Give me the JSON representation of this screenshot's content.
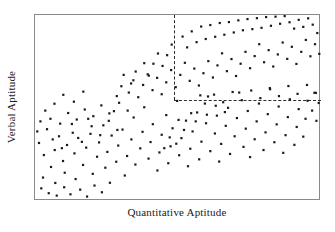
{
  "chart_data": {
    "type": "scatter",
    "title": "",
    "xlabel": "Quantitative Aptitude",
    "ylabel": "Verbal Aptitude",
    "xlim": [
      0,
      100
    ],
    "ylim": [
      0,
      100
    ],
    "grid": false,
    "legend": null,
    "marker": {
      "shape": "square",
      "size_px": 2.2,
      "color": "#1a1a1a"
    },
    "annotations": [
      {
        "type": "selection-region",
        "style": "dashed",
        "color": "#2b2b2b",
        "description": "Dashed lines mark upper-right region: high Quantitative and high Verbal Aptitude",
        "x_threshold": 48.6,
        "y_threshold": 54.3,
        "x_range": [
          48.6,
          100
        ],
        "y_range": [
          54.3,
          100
        ]
      }
    ],
    "series": [
      {
        "name": "Students",
        "n_points": 228,
        "description": "Positively correlated elliptical band rising from lower-left to upper-right",
        "points": [
          [
            1.4,
            31.2
          ],
          [
            3.1,
            24.7
          ],
          [
            4.2,
            38.6
          ],
          [
            5.6,
            18.3
          ],
          [
            2.8,
            12.6
          ],
          [
            6.9,
            27.4
          ],
          [
            8.4,
            34.8
          ],
          [
            7.1,
            9.7
          ],
          [
            9.8,
            21.5
          ],
          [
            11.2,
            30.1
          ],
          [
            10.4,
            15.2
          ],
          [
            12.9,
            41.4
          ],
          [
            13.8,
            25.6
          ],
          [
            15.1,
            33.9
          ],
          [
            14.2,
            11.8
          ],
          [
            16.8,
            19.4
          ],
          [
            17.9,
            28.7
          ],
          [
            18.6,
            44.2
          ],
          [
            19.4,
            36.1
          ],
          [
            20.2,
            14.6
          ],
          [
            21.7,
            23.8
          ],
          [
            22.4,
            31.5
          ],
          [
            23.9,
            40.7
          ],
          [
            24.6,
            17.9
          ],
          [
            25.3,
            26.4
          ],
          [
            26.8,
            35.2
          ],
          [
            27.6,
            48.3
          ],
          [
            28.4,
            21.1
          ],
          [
            29.1,
            29.8
          ],
          [
            30.6,
            38.4
          ],
          [
            31.4,
            13.7
          ],
          [
            32.2,
            24.2
          ],
          [
            33.7,
            33.1
          ],
          [
            34.5,
            44.9
          ],
          [
            35.1,
            19.6
          ],
          [
            36.8,
            28.3
          ],
          [
            37.6,
            37.2
          ],
          [
            38.2,
            50.4
          ],
          [
            39.7,
            22.8
          ],
          [
            40.4,
            31.7
          ],
          [
            41.2,
            41.3
          ],
          [
            42.8,
            16.4
          ],
          [
            43.5,
            26.1
          ],
          [
            44.3,
            35.6
          ],
          [
            45.9,
            46.2
          ],
          [
            46.6,
            20.3
          ],
          [
            47.4,
            29.4
          ],
          [
            48.1,
            39.1
          ],
          [
            49.7,
            53.8
          ],
          [
            50.4,
            24.6
          ],
          [
            51.2,
            33.8
          ],
          [
            52.8,
            43.2
          ],
          [
            53.5,
            18.7
          ],
          [
            54.3,
            28.1
          ],
          [
            55.1,
            37.4
          ],
          [
            56.7,
            47.6
          ],
          [
            57.4,
            22.4
          ],
          [
            58.2,
            31.9
          ],
          [
            59.8,
            41.8
          ],
          [
            60.5,
            56.2
          ],
          [
            61.3,
            26.8
          ],
          [
            62.9,
            36.3
          ],
          [
            63.6,
            45.9
          ],
          [
            64.4,
            21.2
          ],
          [
            65.1,
            30.7
          ],
          [
            66.7,
            40.4
          ],
          [
            67.5,
            50.1
          ],
          [
            68.2,
            25.3
          ],
          [
            69.8,
            34.8
          ],
          [
            70.6,
            44.6
          ],
          [
            71.4,
            58.3
          ],
          [
            72.9,
            29.1
          ],
          [
            73.7,
            38.9
          ],
          [
            74.4,
            48.4
          ],
          [
            75.2,
            23.6
          ],
          [
            76.8,
            33.2
          ],
          [
            77.5,
            42.8
          ],
          [
            78.3,
            52.4
          ],
          [
            79.9,
            27.4
          ],
          [
            80.6,
            36.9
          ],
          [
            81.4,
            46.7
          ],
          [
            82.2,
            60.1
          ],
          [
            83.7,
            31.6
          ],
          [
            84.5,
            41.2
          ],
          [
            85.2,
            50.8
          ],
          [
            86.8,
            25.9
          ],
          [
            87.6,
            35.4
          ],
          [
            88.4,
            45.1
          ],
          [
            89.1,
            54.7
          ],
          [
            90.7,
            30.2
          ],
          [
            91.5,
            39.8
          ],
          [
            92.2,
            49.4
          ],
          [
            93.8,
            34.6
          ],
          [
            94.6,
            44.2
          ],
          [
            95.3,
            53.9
          ],
          [
            96.9,
            48.6
          ],
          [
            97.7,
            58.2
          ],
          [
            98.4,
            43.1
          ],
          [
            99.2,
            52.7
          ],
          [
            28.6,
            56.4
          ],
          [
            30.2,
            61.7
          ],
          [
            32.8,
            58.3
          ],
          [
            34.4,
            64.9
          ],
          [
            36.1,
            55.8
          ],
          [
            37.8,
            62.4
          ],
          [
            39.4,
            68.1
          ],
          [
            41.1,
            59.6
          ],
          [
            42.7,
            66.2
          ],
          [
            44.3,
            57.4
          ],
          [
            45.9,
            63.8
          ],
          [
            47.6,
            70.4
          ],
          [
            49.2,
            61.2
          ],
          [
            50.8,
            67.8
          ],
          [
            52.4,
            74.3
          ],
          [
            54.1,
            64.6
          ],
          [
            55.7,
            71.2
          ],
          [
            57.3,
            62.1
          ],
          [
            58.9,
            68.7
          ],
          [
            60.6,
            75.2
          ],
          [
            62.2,
            66.4
          ],
          [
            63.8,
            72.9
          ],
          [
            65.4,
            79.4
          ],
          [
            67.1,
            69.8
          ],
          [
            68.7,
            76.3
          ],
          [
            70.3,
            67.2
          ],
          [
            71.9,
            73.8
          ],
          [
            73.6,
            80.2
          ],
          [
            75.2,
            71.4
          ],
          [
            76.8,
            77.9
          ],
          [
            78.4,
            84.3
          ],
          [
            80.1,
            74.6
          ],
          [
            81.7,
            81.1
          ],
          [
            83.3,
            72.3
          ],
          [
            84.9,
            78.8
          ],
          [
            86.6,
            85.2
          ],
          [
            88.2,
            76.4
          ],
          [
            89.8,
            82.9
          ],
          [
            91.4,
            73.7
          ],
          [
            93.1,
            80.2
          ],
          [
            94.7,
            86.6
          ],
          [
            96.3,
            77.8
          ],
          [
            97.9,
            84.3
          ],
          [
            99.4,
            79.1
          ],
          [
            51.6,
            88.4
          ],
          [
            53.2,
            82.6
          ],
          [
            54.8,
            91.2
          ],
          [
            56.5,
            85.4
          ],
          [
            58.1,
            93.8
          ],
          [
            59.7,
            87.1
          ],
          [
            61.3,
            94.6
          ],
          [
            63.0,
            88.3
          ],
          [
            64.6,
            95.7
          ],
          [
            66.2,
            89.4
          ],
          [
            67.8,
            96.2
          ],
          [
            69.5,
            90.6
          ],
          [
            71.1,
            97.1
          ],
          [
            72.7,
            91.8
          ],
          [
            74.3,
            97.8
          ],
          [
            76.0,
            92.4
          ],
          [
            77.6,
            98.3
          ],
          [
            79.2,
            93.1
          ],
          [
            80.8,
            98.9
          ],
          [
            82.5,
            94.2
          ],
          [
            84.1,
            99.1
          ],
          [
            85.7,
            95.3
          ],
          [
            87.3,
            99.4
          ],
          [
            89.0,
            96.1
          ],
          [
            90.6,
            92.7
          ],
          [
            92.2,
            97.4
          ],
          [
            93.8,
            93.6
          ],
          [
            95.5,
            98.2
          ],
          [
            97.1,
            94.8
          ],
          [
            98.7,
            90.3
          ],
          [
            46.2,
            78.4
          ],
          [
            47.8,
            84.1
          ],
          [
            44.6,
            72.6
          ],
          [
            43.0,
            79.3
          ],
          [
            41.4,
            73.8
          ],
          [
            39.8,
            67.4
          ],
          [
            38.2,
            74.1
          ],
          [
            35.2,
            69.6
          ],
          [
            33.6,
            63.2
          ],
          [
            31.0,
            67.8
          ],
          [
            2.2,
            6.8
          ],
          [
            4.8,
            4.2
          ],
          [
            7.6,
            2.9
          ],
          [
            10.2,
            7.4
          ],
          [
            12.4,
            3.6
          ],
          [
            15.8,
            6.1
          ],
          [
            18.2,
            2.4
          ],
          [
            20.8,
            8.3
          ],
          [
            23.4,
            4.7
          ],
          [
            26.2,
            9.8
          ],
          [
            5.4,
            44.2
          ],
          [
            8.8,
            41.6
          ],
          [
            11.6,
            47.3
          ],
          [
            14.6,
            43.8
          ],
          [
            17.4,
            49.2
          ],
          [
            20.4,
            45.6
          ],
          [
            23.2,
            51.4
          ],
          [
            26.0,
            47.1
          ],
          [
            29.4,
            52.8
          ],
          [
            32.4,
            48.6
          ],
          [
            0.8,
            37.4
          ],
          [
            1.9,
            42.8
          ],
          [
            6.2,
            33.1
          ],
          [
            9.4,
            28.4
          ],
          [
            13.2,
            36.7
          ],
          [
            16.4,
            31.8
          ],
          [
            19.8,
            40.2
          ],
          [
            22.8,
            35.4
          ],
          [
            25.8,
            43.1
          ],
          [
            28.8,
            38.2
          ],
          [
            3.6,
            48.6
          ],
          [
            6.8,
            52.3
          ],
          [
            9.9,
            57.1
          ],
          [
            13.6,
            53.4
          ],
          [
            16.9,
            58.8
          ],
          [
            57.8,
            56.8
          ],
          [
            59.4,
            52.4
          ],
          [
            62.6,
            57.2
          ],
          [
            65.8,
            53.1
          ],
          [
            69.1,
            58.6
          ],
          [
            72.3,
            54.2
          ],
          [
            75.6,
            59.4
          ],
          [
            78.8,
            55.3
          ],
          [
            82.1,
            60.7
          ],
          [
            85.3,
            56.4
          ],
          [
            88.6,
            61.8
          ],
          [
            91.8,
            57.6
          ],
          [
            95.1,
            62.4
          ],
          [
            98.2,
            58.1
          ],
          [
            54.6,
            47.2
          ],
          [
            56.2,
            42.8
          ],
          [
            60.1,
            46.4
          ],
          [
            63.2,
            51.2
          ],
          [
            66.4,
            47.8
          ],
          [
            50.2,
            43.6
          ],
          [
            52.1,
            38.2
          ],
          [
            47.1,
            34.2
          ],
          [
            49.4,
            30.8
          ],
          [
            45.2,
            28.4
          ]
        ]
      }
    ]
  },
  "axes": {
    "xlabel": "Quantitative Aptitude",
    "ylabel": "Verbal Aptitude"
  }
}
